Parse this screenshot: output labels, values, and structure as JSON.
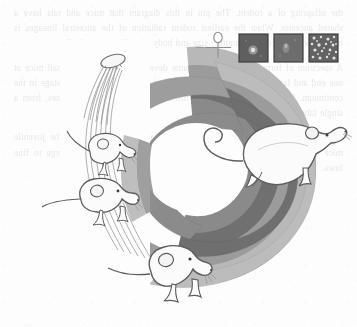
{
  "page": {
    "kind": "scanned-book-illustration",
    "background_color": "#fdfdfd",
    "width": 357,
    "height": 327,
    "caption_visible": false,
    "bleed_through_text": [
      "the offspring of a rodent. The pin in this diagram",
      "that mice and rats have a shared ancestor. When",
      "the earliest rodent radiation of the ancestral",
      "lineages is traced back to a common source, size",
      "and body plan diverge gradually.",
      "A spectrum of forms arises from the same",
      "developmental program: small mice at one end and",
      "larger rats at the other. Each band in the figure",
      "marks a stage in the continuum. Histological",
      "sections (see insets) show the cellular",
      "correlates, from a single labelled cell to a",
      "field of many.",
      "The arc is read counter-clockwise from the",
      "large adult rat toward the juvenile mice",
      "clustered at the inner terminus, where the",
      "graded bands converge to fine lines."
    ]
  },
  "artwork": {
    "title": "Rodent size continuum arc",
    "description": "A thick horseshoe-shaped arc of four graded grey bands, opening to the left. A large white rat walks on the outer right bands; three smaller mice are arranged along the inner left and bottom of the arc; a tuft/knot object sits at the top-left terminus of the arc with fine strands trailing from it.",
    "arc": {
      "shape": "horseshoe",
      "opening_direction": "left",
      "band_count": 4,
      "band_colors": [
        "#b7b7b7",
        "#9a9a9a",
        "#6e6e6e",
        "#848484"
      ],
      "band_labels": [
        "band-outermost-light",
        "band-second-medium",
        "band-third-dark",
        "band-innermost-mid"
      ],
      "outline_color": "#8d8d8d",
      "taper_note": "bands taper to thin lines at the left terminus"
    },
    "animals": [
      {
        "id": "large-rat",
        "label": "Large rat",
        "position": "outer right of arc, facing up-right",
        "body_fill": "#fbfbfb",
        "outline": "#5d5d5d",
        "has_long_tail": true
      },
      {
        "id": "mouse-lower",
        "label": "Mouse, bottom",
        "position": "bottom centre of arc, facing right",
        "body_fill": "#fbfbfb",
        "outline": "#5d5d5d",
        "has_long_tail": true
      },
      {
        "id": "mouse-middle",
        "label": "Mouse, middle left",
        "position": "left inner flank of arc, facing right",
        "body_fill": "#fbfbfb",
        "outline": "#5d5d5d",
        "has_long_tail": true
      },
      {
        "id": "mouse-upper",
        "label": "Mouse, upper left",
        "position": "upper left inner flank of arc, facing down-right",
        "body_fill": "#fbfbfb",
        "outline": "#5d5d5d",
        "has_long_tail": true
      }
    ],
    "tuft": {
      "id": "tuft-knot",
      "label": "Tuft with trailing strands",
      "position": "top-left terminus of arc",
      "strand_count": 6,
      "outline": "#6b6b6b"
    },
    "pin_symbol": {
      "id": "pin-ankh",
      "label": "Pin / ankh marker",
      "position": "top, left of the micrograph insets",
      "outline": "#8a8a8a"
    },
    "micrographs": [
      {
        "id": "micrograph-1",
        "label": "Inset 1 — single labelled cell",
        "frame_color": "#6a6a6a",
        "field_color": "#5f5f5f",
        "dot_count": 1,
        "dot_color": "#d9d9d9"
      },
      {
        "id": "micrograph-2",
        "label": "Inset 2 — faint diffuse signal",
        "frame_color": "#6a6a6a",
        "field_color": "#6d6d6d",
        "dot_count": 2,
        "dot_color": "#9b9b9b"
      },
      {
        "id": "micrograph-3",
        "label": "Inset 3 — many scattered cells",
        "frame_color": "#6a6a6a",
        "field_color": "#636363",
        "dot_count": 22,
        "dot_color": "#e2e2e2"
      }
    ]
  }
}
